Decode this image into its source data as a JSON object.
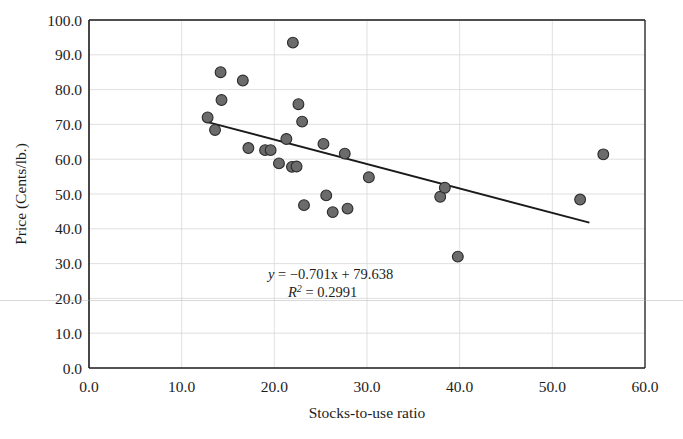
{
  "chart_data": {
    "type": "scatter",
    "title": "",
    "xlabel": "Stocks-to-use ratio",
    "ylabel": "Price (Cents/lb.)",
    "xlim": [
      0.0,
      60.0
    ],
    "ylim": [
      0.0,
      100.0
    ],
    "xticks": [
      "0.0",
      "10.0",
      "20.0",
      "30.0",
      "40.0",
      "50.0",
      "60.0"
    ],
    "yticks": [
      "0.0",
      "10.0",
      "20.0",
      "30.0",
      "40.0",
      "50.0",
      "60.0",
      "70.0",
      "80.0",
      "90.0",
      "100.0"
    ],
    "grid": true,
    "legend": "none",
    "marker_color": "#6b6b6b",
    "marker_edge_color": "#2b2b2b",
    "line_color": "#1a1a1a",
    "points": [
      {
        "x": 12.8,
        "y": 72.0
      },
      {
        "x": 13.6,
        "y": 68.4
      },
      {
        "x": 14.2,
        "y": 85.0
      },
      {
        "x": 14.3,
        "y": 77.0
      },
      {
        "x": 16.6,
        "y": 82.6
      },
      {
        "x": 17.2,
        "y": 63.2
      },
      {
        "x": 19.0,
        "y": 62.6
      },
      {
        "x": 19.6,
        "y": 62.6
      },
      {
        "x": 20.5,
        "y": 58.8
      },
      {
        "x": 21.3,
        "y": 65.8
      },
      {
        "x": 21.9,
        "y": 57.8
      },
      {
        "x": 22.4,
        "y": 57.9
      },
      {
        "x": 22.0,
        "y": 93.5
      },
      {
        "x": 22.6,
        "y": 75.8
      },
      {
        "x": 23.0,
        "y": 70.8
      },
      {
        "x": 23.2,
        "y": 46.8
      },
      {
        "x": 25.3,
        "y": 64.4
      },
      {
        "x": 25.6,
        "y": 49.6
      },
      {
        "x": 26.3,
        "y": 44.8
      },
      {
        "x": 27.6,
        "y": 61.6
      },
      {
        "x": 27.9,
        "y": 45.8
      },
      {
        "x": 30.2,
        "y": 54.8
      },
      {
        "x": 37.9,
        "y": 49.2
      },
      {
        "x": 38.4,
        "y": 51.8
      },
      {
        "x": 39.8,
        "y": 32.0
      },
      {
        "x": 53.0,
        "y": 48.4
      },
      {
        "x": 55.5,
        "y": 61.4
      }
    ],
    "trendline": {
      "slope": -0.701,
      "intercept": 79.638,
      "x_start": 12.5,
      "x_end": 54.0,
      "r_squared": 0.2991
    },
    "annotations": {
      "equation_prefix": "y",
      "equation_body": " = −0.701x + 79.638",
      "r2_symbol": "R",
      "r2_sup": "2",
      "r2_body": " = 0.2991"
    }
  }
}
